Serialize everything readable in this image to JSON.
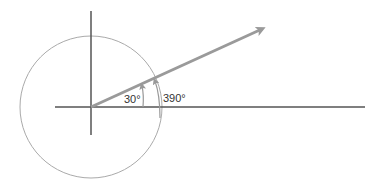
{
  "diagram": {
    "labels": {
      "angle_small": "30°",
      "angle_large": "390°"
    },
    "colors": {
      "axes": "#555555",
      "circle": "#aaaaaa",
      "vector": "#9a9a9a",
      "arc_arrows": "#999999",
      "text": "#333333"
    }
  }
}
